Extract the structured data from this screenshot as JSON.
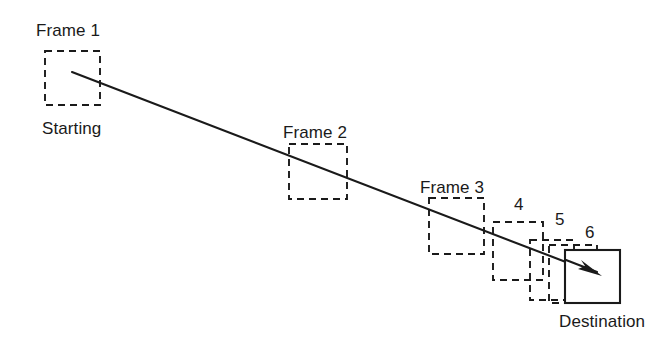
{
  "diagram": {
    "background_color": "#ffffff",
    "stroke_color": "#1a1a1a",
    "labels": {
      "frame1": "Frame 1",
      "starting": "Starting",
      "frame2": "Frame 2",
      "frame3": "Frame 3",
      "frame4": "4",
      "frame5": "5",
      "frame6": "6",
      "destination": "Destination"
    },
    "boxes": [
      {
        "id": "frame-1",
        "label": "Frame 1",
        "style": "dashed",
        "x": 45,
        "y": 51,
        "width": 55,
        "height": 54
      },
      {
        "id": "frame-2",
        "label": "Frame 2",
        "style": "dashed",
        "x": 289,
        "y": 144,
        "width": 58,
        "height": 55
      },
      {
        "id": "frame-3",
        "label": "Frame 3",
        "style": "dashed",
        "x": 429,
        "y": 198,
        "width": 55,
        "height": 56
      },
      {
        "id": "frame-4",
        "label": "4",
        "style": "dashed",
        "x": 493,
        "y": 222,
        "width": 50,
        "height": 58
      },
      {
        "id": "frame-5",
        "label": "5",
        "style": "dashed",
        "x": 530,
        "y": 240,
        "width": 44,
        "height": 60
      },
      {
        "id": "frame-6",
        "label": "6",
        "style": "dashed",
        "x": 549,
        "y": 245,
        "width": 48,
        "height": 58
      },
      {
        "id": "destination",
        "label": "Destination",
        "style": "solid",
        "x": 565,
        "y": 250,
        "width": 55,
        "height": 53
      }
    ],
    "trajectory": {
      "start_x": 72,
      "start_y": 72,
      "end_x": 601,
      "end_y": 276,
      "arrow": "arrow-head-right-down"
    },
    "label_positions": {
      "frame1": {
        "x": 36,
        "y": 22
      },
      "starting": {
        "x": 42,
        "y": 120
      },
      "frame2": {
        "x": 283,
        "y": 124
      },
      "frame3": {
        "x": 420,
        "y": 179
      },
      "frame4": {
        "x": 514,
        "y": 196
      },
      "frame5": {
        "x": 555,
        "y": 211
      },
      "frame6": {
        "x": 585,
        "y": 224
      },
      "destination": {
        "x": 559,
        "y": 313
      }
    }
  }
}
